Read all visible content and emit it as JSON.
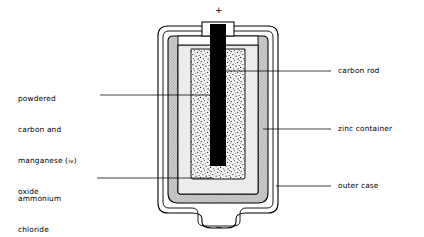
{
  "diagram": {
    "terminals": {
      "positive": "+",
      "negative": "−"
    },
    "labels": {
      "left": [
        {
          "id": "powdered-carbon-manganese-oxide",
          "lines": [
            "powdered",
            "carbon and",
            "manganese (",
            "oxide"
          ],
          "roman": "iv",
          "tail": ")"
        },
        {
          "id": "ammonium-chloride-paste",
          "lines": [
            "ammonium",
            "chloride",
            "paste"
          ]
        }
      ],
      "right": [
        {
          "id": "carbon-rod",
          "text": "carbon rod"
        },
        {
          "id": "zinc-container",
          "text": "zinc container"
        },
        {
          "id": "outer-case",
          "text": "outer case"
        }
      ]
    },
    "colors": {
      "outline": "#000000",
      "outer_case_fill": "#ffffff",
      "zinc_fill": "#c9c9c9",
      "paste_fill": "#e9e9e9",
      "powder_fill": "#f2f2f2",
      "powder_speckle": "#1a1a1a",
      "carbon_rod_fill": "#000000",
      "background": "#ffffff"
    }
  }
}
